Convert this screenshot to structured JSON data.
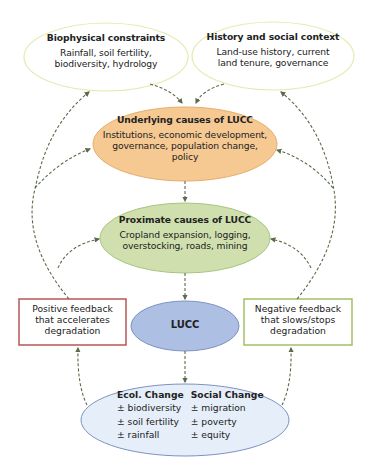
{
  "nodes": {
    "biophysical": {
      "title": "Biophysical constraints",
      "body_lines": [
        "Rainfall, soil fertility,",
        "biodiversity, hydrology"
      ],
      "fill": "#ffffff",
      "stroke": "#e5ebb0"
    },
    "history": {
      "title": "History and social context",
      "body_lines": [
        "Land-use history, current",
        "land tenure, governance"
      ],
      "fill": "#ffffff",
      "stroke": "#e5ebb0"
    },
    "underlying": {
      "title": "Underlying causes of LUCC",
      "body_lines": [
        "Institutions, economic development,",
        "governance, population change,",
        "policy"
      ],
      "fill": "#f6c993",
      "stroke": "#e6ad6c"
    },
    "proximate": {
      "title": "Proximate causes of LUCC",
      "body_lines": [
        "Cropland expansion, logging,",
        "overstocking, roads, mining"
      ],
      "fill": "#cfe0ae",
      "stroke": "#a9c47f"
    },
    "lucc": {
      "title": "LUCC",
      "fill": "#adbfe3",
      "stroke": "#7d92c4"
    },
    "positive_feedback": {
      "lines": [
        "Positive feedback",
        "that accelerates",
        "degradation"
      ],
      "stroke": "#b64a4a"
    },
    "negative_feedback": {
      "lines": [
        "Negative feedback",
        "that slows/stops",
        "degradation"
      ],
      "stroke": "#9dbb5a"
    },
    "change": {
      "fill": "#e5eef9",
      "stroke": "#7d92c4",
      "columns": [
        {
          "header": "Ecol. Change",
          "items": [
            "± biodiversity",
            "± soil fertility",
            "± rainfall"
          ]
        },
        {
          "header": "Social Change",
          "items": [
            "± migration",
            "± poverty",
            "± equity"
          ]
        }
      ]
    }
  },
  "edges": [
    {
      "from": "biophysical",
      "to": "underlying",
      "style": "dashed"
    },
    {
      "from": "history",
      "to": "underlying",
      "style": "dashed"
    },
    {
      "from": "underlying",
      "to": "proximate",
      "style": "dashed"
    },
    {
      "from": "proximate",
      "to": "lucc",
      "style": "dashed"
    },
    {
      "from": "lucc",
      "to": "change",
      "style": "dashed"
    },
    {
      "from": "change",
      "to": "positive_feedback",
      "style": "dashed"
    },
    {
      "from": "change",
      "to": "negative_feedback",
      "style": "dashed"
    },
    {
      "from": "positive_feedback",
      "to": "biophysical",
      "style": "dashed"
    },
    {
      "from": "positive_feedback",
      "to": "underlying",
      "style": "dashed"
    },
    {
      "from": "positive_feedback",
      "to": "proximate",
      "style": "dashed"
    },
    {
      "from": "negative_feedback",
      "to": "history",
      "style": "dashed"
    },
    {
      "from": "negative_feedback",
      "to": "underlying",
      "style": "dashed"
    },
    {
      "from": "negative_feedback",
      "to": "proximate",
      "style": "dashed"
    }
  ],
  "arrow_color": "#5a6b4a"
}
